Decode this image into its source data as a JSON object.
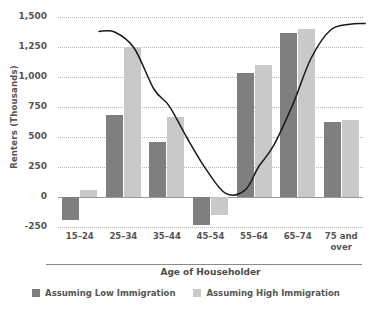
{
  "chart_data": {
    "type": "bar",
    "title": "",
    "xlabel": "Age of Householder",
    "ylabel": "Renters (Thousands)",
    "categories": [
      "15–24",
      "25–34",
      "35–44",
      "45–54",
      "55–64",
      "65–74",
      "75 and over"
    ],
    "series": [
      {
        "name": "Assuming Low Immigration",
        "color": "#7f7f7f",
        "values": [
          -190,
          685,
          460,
          -230,
          1035,
          1370,
          625
        ]
      },
      {
        "name": "Assuming High Immigration",
        "color": "#c9c9c9",
        "values": [
          60,
          1250,
          665,
          -150,
          1100,
          1400,
          640
        ]
      }
    ],
    "trend_line": {
      "name": "smoothed trend",
      "color": "#1a1a1a",
      "points": [
        {
          "x": 0.44,
          "y": 1380
        },
        {
          "x": 0.8,
          "y": 1375
        },
        {
          "x": 1.25,
          "y": 1240
        },
        {
          "x": 1.7,
          "y": 900
        },
        {
          "x": 2.05,
          "y": 760
        },
        {
          "x": 2.45,
          "y": 500
        },
        {
          "x": 2.9,
          "y": 230
        },
        {
          "x": 3.35,
          "y": 30
        },
        {
          "x": 3.8,
          "y": 60
        },
        {
          "x": 4.1,
          "y": 250
        },
        {
          "x": 4.45,
          "y": 430
        },
        {
          "x": 4.9,
          "y": 780
        },
        {
          "x": 5.3,
          "y": 1150
        },
        {
          "x": 5.75,
          "y": 1390
        },
        {
          "x": 6.2,
          "y": 1440
        },
        {
          "x": 6.55,
          "y": 1445
        }
      ]
    },
    "yticks": [
      "1,500",
      "1,250",
      "1,000",
      "750",
      "500",
      "250",
      "0",
      "-250"
    ],
    "ytick_values": [
      1500,
      1250,
      1000,
      750,
      500,
      250,
      0,
      -250
    ],
    "ylim": [
      -250,
      1500
    ],
    "grid": true,
    "legend_position": "bottom"
  },
  "legend": {
    "items": [
      {
        "label": "Assuming Low Immigration",
        "color": "#7f7f7f"
      },
      {
        "label": "Assuming High Immigration",
        "color": "#c9c9c9"
      }
    ]
  }
}
